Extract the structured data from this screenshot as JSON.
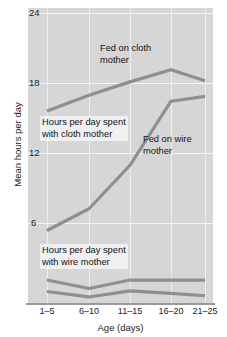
{
  "chart_data": {
    "type": "line",
    "title": "",
    "subtitle": "",
    "xlabel": "Age (days)",
    "ylabel": "Mean hours per day",
    "categories": [
      "1–5",
      "6–10",
      "11–15",
      "16–20",
      "21–25"
    ],
    "ylim": [
      0,
      24
    ],
    "yticks": [
      6,
      12,
      18,
      24
    ],
    "ytick_labels": [
      "6",
      "12",
      "18",
      "24"
    ],
    "grid": true,
    "legend": "none (inline annotations)",
    "series": [
      {
        "name": "Hours per day spent with cloth mother",
        "values": [
          15.9,
          17.2,
          18.3,
          19.3,
          18.4
        ],
        "color": "#8f8f8f"
      },
      {
        "name": "Fed on wire mother",
        "values": [
          6.0,
          7.8,
          11.4,
          16.7,
          17.1
        ],
        "color": "#8f8f8f"
      },
      {
        "name": "Hours per day spent with wire mother (upper)",
        "values": [
          1.9,
          1.2,
          1.9,
          1.9,
          1.9
        ],
        "color": "#8f8f8f"
      },
      {
        "name": "Hours per day spent with wire mother (lower)",
        "values": [
          0.95,
          0.5,
          1.0,
          0.8,
          0.6
        ],
        "color": "#8f8f8f"
      }
    ],
    "annotations": [
      {
        "id": "fed-on-cloth-mother",
        "text": "Fed on cloth\nmother",
        "x_frac": 0.33,
        "y_val": 21.4
      },
      {
        "id": "cloth-mother-contact",
        "text": "Hours per day spent\nwith cloth mother",
        "x_frac": 0.055,
        "y_val": 14.4
      },
      {
        "id": "fed-on-wire-mother",
        "text": "Fed on wire\nmother",
        "x_frac": 0.555,
        "y_val": 13.0
      },
      {
        "id": "wire-mother-contact",
        "text": "Hours per day spent\nwith wire mother",
        "x_frac": 0.055,
        "y_val": 4.4
      }
    ],
    "colors": {
      "plot_background": "#d6d6d6",
      "gridline": "#f4f4f4",
      "line": "#8f8f8f",
      "axis": "#9a9a9a",
      "text": "#1b1b1b"
    }
  },
  "axis": {
    "y_title": "Mean hours per day",
    "x_title": "Age (days)",
    "y_ticks": [
      "24",
      "18",
      "12",
      "6"
    ],
    "x_ticks": [
      "1–5",
      "6–10",
      "11–15",
      "16–20",
      "21–25"
    ]
  },
  "annotations": {
    "a0": "Fed on cloth\nmother",
    "a1": "Hours per day spent\nwith cloth mother",
    "a2": "Fed on wire\nmother",
    "a3": "Hours per day spent\nwith wire mother"
  }
}
